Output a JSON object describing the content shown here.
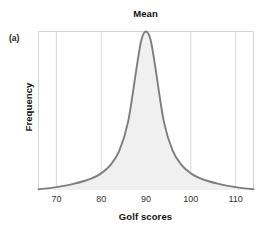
{
  "panel": {
    "letter": "(a)"
  },
  "chart_data": {
    "type": "line",
    "title": "Mean",
    "xlabel": "Golf scores",
    "ylabel": "Frequency",
    "grid": true,
    "legend": false,
    "xlim": [
      66,
      114
    ],
    "ylim": [
      0,
      1
    ],
    "xticks": [
      70,
      80,
      90,
      100,
      110
    ],
    "xtick_labels": [
      "70",
      "80",
      "90",
      "100",
      "110"
    ],
    "yticks": [],
    "ytick_labels": [],
    "annotations": [
      {
        "text": "Mean",
        "x": 90,
        "note": "vertical reference gridline at the distribution mean, labelled above the plot"
      }
    ],
    "series": [
      {
        "name": "Golf score frequency distribution",
        "shape": "symmetric unimodal leptokurtic bell curve",
        "mean": 90,
        "mode": 90,
        "median": 90,
        "fill": "#f0f0f0",
        "stroke": "#7d7d7d",
        "x": [
          66,
          68,
          70,
          72,
          74,
          76,
          78,
          80,
          82,
          84,
          86,
          88,
          89,
          90,
          91,
          92,
          94,
          96,
          98,
          100,
          102,
          104,
          106,
          108,
          110,
          112,
          114
        ],
        "y": [
          0.005,
          0.01,
          0.018,
          0.028,
          0.04,
          0.055,
          0.075,
          0.105,
          0.155,
          0.245,
          0.43,
          0.79,
          0.95,
          1.0,
          0.95,
          0.79,
          0.43,
          0.245,
          0.155,
          0.105,
          0.075,
          0.055,
          0.04,
          0.028,
          0.018,
          0.01,
          0.005
        ]
      }
    ]
  },
  "colors": {
    "curve_stroke": "#7d7d7d",
    "curve_fill": "#f0f0f0",
    "gridline": "#d6d6d6",
    "frame": "#cfcfcf",
    "text": "#111111"
  }
}
